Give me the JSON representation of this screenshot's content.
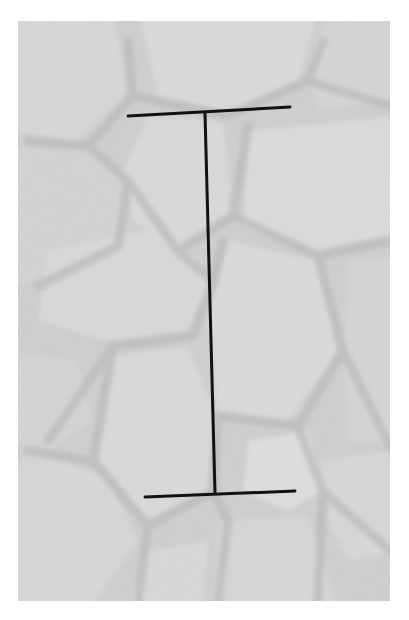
{
  "image": {
    "subject": "stone wall texture (grayscale photograph)",
    "background_color": "#ffffff",
    "photo_tone": "#d4d4d4",
    "joint_tone": "#a9a9a9",
    "stone_tone": "#e2e2e2"
  },
  "measurement_marker": {
    "shape": "I-beam",
    "color": "#111111",
    "top_bar": {
      "x1": 128,
      "y1": 116,
      "x2": 290,
      "y2": 107
    },
    "vertical": {
      "x1": 205,
      "y1": 113,
      "x2": 215,
      "y2": 493
    },
    "bottom_bar": {
      "x1": 145,
      "y1": 497,
      "x2": 295,
      "y2": 491
    }
  }
}
